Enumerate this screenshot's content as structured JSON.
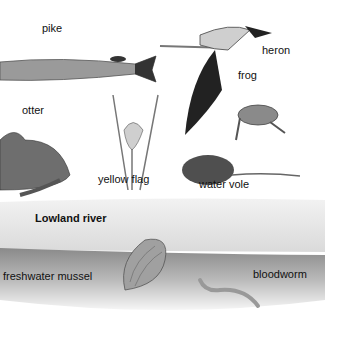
{
  "title": "Lowland river",
  "labels": {
    "pike": "pike",
    "heron": "heron",
    "frog": "frog",
    "otter": "otter",
    "yellow_flag": "yellow flag",
    "water_vole": "water vole",
    "freshwater_mussel": "freshwater mussel",
    "bloodworm": "bloodworm"
  }
}
